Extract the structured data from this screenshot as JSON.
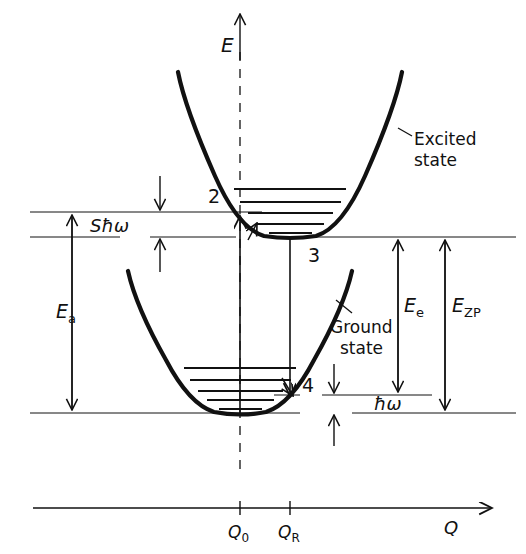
{
  "figure": {
    "type": "configuration-coordinate-diagram",
    "background": "#ffffff",
    "ink": "#111111",
    "axes": {
      "energy_axis_label": "E",
      "coordinate_axis_label": "Q",
      "energy_axis_style": "dashed-vertical-with-arrow",
      "coordinate_axis_style": "solid-horizontal-with-arrow",
      "ticks": [
        {
          "name": "Q0",
          "base": "Q",
          "sub": "0"
        },
        {
          "name": "QR",
          "base": "Q",
          "sub": "R"
        }
      ]
    },
    "curves": [
      {
        "name": "excited-state-parabola",
        "label": "Excited\nstate",
        "label_line1": "Excited",
        "label_line2": "state",
        "levels": 5
      },
      {
        "name": "ground-state-parabola",
        "label": "Ground\nstate",
        "label_line1": "Ground",
        "label_line2": "state",
        "levels": 5
      }
    ],
    "energy_labels": [
      {
        "name": "E-absorption",
        "base": "E",
        "sub": "a"
      },
      {
        "name": "E-emission",
        "base": "E",
        "sub": "e"
      },
      {
        "name": "E-zero-phonon",
        "base": "E",
        "sub": "ZP"
      }
    ],
    "phonon_labels": [
      {
        "name": "stokes-shift",
        "text": "Sħω"
      },
      {
        "name": "phonon-energy",
        "text": "ħω"
      }
    ],
    "process_numbers": [
      {
        "name": "process-2",
        "text": "2"
      },
      {
        "name": "process-3",
        "text": "3"
      },
      {
        "name": "process-4",
        "text": "4"
      }
    ]
  }
}
